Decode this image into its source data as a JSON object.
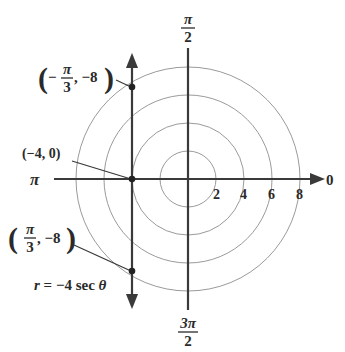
{
  "diagram": {
    "type": "polar_graph",
    "equation": "r = −4 sec θ",
    "equation_parts": {
      "lhs": "r",
      "eq": " = −4 sec ",
      "theta": "θ"
    },
    "colors": {
      "axis": "#3a3a3a",
      "circle": "#9a9a9a",
      "point": "#222222"
    },
    "angle_labels": {
      "zero": "0",
      "pi_over_2": {
        "num": "π",
        "den": "2"
      },
      "pi": "π",
      "three_pi_over_2": {
        "num": "3π",
        "den": "2"
      }
    },
    "radius_ticks": [
      "2",
      "4",
      "6",
      "8"
    ],
    "points": [
      {
        "label_open": "(",
        "sign": "−",
        "num": "π",
        "den": "3",
        "rest": ", −8",
        "label_close": ")",
        "r": -8,
        "theta": "-π/3"
      },
      {
        "label": "(−4, 0)",
        "r": -4,
        "theta": "0"
      },
      {
        "label_open": "(",
        "sign": "",
        "num": "π",
        "den": "3",
        "rest": ", −8",
        "label_close": ")",
        "r": -8,
        "theta": "π/3"
      }
    ]
  }
}
